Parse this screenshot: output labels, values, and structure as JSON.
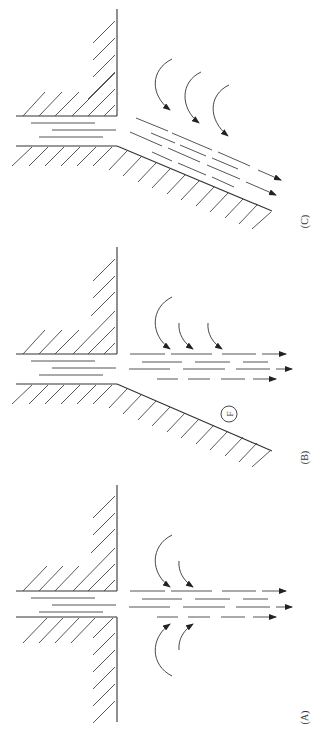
{
  "figure": {
    "type": "fluid-jet-diagram",
    "orientation": "rotated-90-ccw",
    "panels": [
      {
        "id": "C",
        "label": "(C)",
        "description": "Jet attached to inclined wall (Coanda effect), entrainment from one side only"
      },
      {
        "id": "B",
        "label": "(B)",
        "description": "Jet with inclined wall, entrainment from one side, region F marked",
        "marker": "F"
      },
      {
        "id": "A",
        "label": "(A)",
        "description": "Free jet, entrainment from both sides"
      }
    ]
  }
}
